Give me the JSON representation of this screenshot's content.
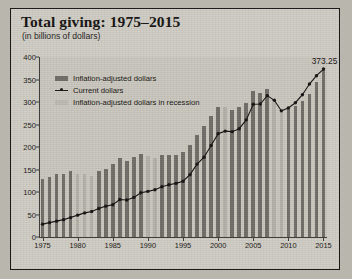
{
  "chart_data": {
    "type": "bar",
    "title": "Total giving: 1975–2015",
    "subtitle": "(in billions of dollars)",
    "xlabel": "",
    "ylabel": "",
    "ylim": [
      0,
      400
    ],
    "yticks": [
      0,
      50,
      100,
      150,
      200,
      250,
      300,
      350,
      400
    ],
    "xticks": [
      "1975",
      "1980",
      "1985",
      "1990",
      "1995",
      "2000",
      "2005",
      "2010",
      "2015"
    ],
    "grid": false,
    "legend_position": "upper-left",
    "categories": [
      "1975",
      "1976",
      "1977",
      "1978",
      "1979",
      "1980",
      "1981",
      "1982",
      "1983",
      "1984",
      "1985",
      "1986",
      "1987",
      "1988",
      "1989",
      "1990",
      "1991",
      "1992",
      "1993",
      "1994",
      "1995",
      "1996",
      "1997",
      "1998",
      "1999",
      "2000",
      "2001",
      "2002",
      "2003",
      "2004",
      "2005",
      "2006",
      "2007",
      "2008",
      "2009",
      "2010",
      "2011",
      "2012",
      "2013",
      "2014",
      "2015"
    ],
    "recession_years": [
      "1980",
      "1981",
      "1982",
      "1990",
      "1991",
      "2001",
      "2008",
      "2009"
    ],
    "series": [
      {
        "name": "Inflation-adjusted dollars",
        "kind": "bar",
        "color": "#6f6c66",
        "values": [
          129,
          134,
          139,
          141,
          146,
          140,
          139,
          136,
          146,
          152,
          163,
          176,
          170,
          177,
          184,
          180,
          176,
          182,
          183,
          182,
          189,
          205,
          226,
          247,
          270,
          290,
          289,
          282,
          288,
          298,
          324,
          320,
          329,
          300,
          284,
          285,
          292,
          302,
          318,
          345,
          373
        ]
      },
      {
        "name": "Current dollars",
        "kind": "line",
        "color": "#131110",
        "values": [
          28.6,
          31.9,
          35.2,
          38.6,
          43.1,
          48.6,
          53.6,
          56.5,
          63.2,
          68.6,
          71.7,
          83.2,
          82.2,
          88.0,
          98.3,
          101.4,
          105.0,
          111.6,
          116.1,
          119.2,
          124.0,
          138.6,
          162.0,
          177.4,
          203.2,
          229.7,
          235.3,
          234.1,
          240.7,
          260.3,
          295.0,
          295.5,
          314.1,
          303.8,
          280.3,
          286.9,
          298.4,
          316.2,
          339.9,
          358.4,
          373.25
        ],
        "annotation": {
          "label": "373.25",
          "year": "2015",
          "value": 373.25
        }
      }
    ],
    "legend": [
      {
        "label": "Inflation-adjusted dollars",
        "marker": "bar-dark"
      },
      {
        "label": "Current dollars",
        "marker": "line-point"
      },
      {
        "label": "Inflation-adjusted dollars in recession",
        "marker": "bar-light"
      }
    ]
  }
}
